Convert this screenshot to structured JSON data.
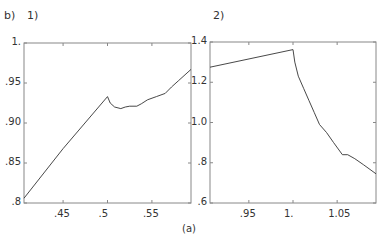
{
  "figure": {
    "panel_b_label": "b)",
    "panel1_label": "1)",
    "panel2_label": "2)",
    "caption": "(a)"
  },
  "chart_data": [
    {
      "type": "line",
      "title": "1)",
      "xlabel": "",
      "ylabel": "",
      "xlim": [
        0.406,
        0.594
      ],
      "ylim": [
        0.8,
        1.0
      ],
      "xticks": [
        0.45,
        0.5,
        0.55
      ],
      "xtick_labels": [
        ".45",
        ".5",
        ".55"
      ],
      "yticks": [
        0.8,
        0.85,
        0.9,
        0.95,
        1.0
      ],
      "ytick_labels": [
        ".8",
        ".85",
        ".90",
        ".95",
        "1."
      ],
      "grid": false,
      "series": [
        {
          "name": "curve",
          "x": [
            0.406,
            0.45,
            0.5,
            0.503,
            0.508,
            0.515,
            0.52,
            0.525,
            0.533,
            0.538,
            0.545,
            0.555,
            0.565,
            0.572,
            0.58,
            0.594
          ],
          "y": [
            0.806,
            0.868,
            0.933,
            0.925,
            0.92,
            0.918,
            0.92,
            0.921,
            0.921,
            0.924,
            0.929,
            0.933,
            0.937,
            0.945,
            0.953,
            0.967
          ]
        }
      ]
    },
    {
      "type": "line",
      "title": "2)",
      "xlabel": "",
      "ylabel": "",
      "xlim": [
        0.906,
        1.094
      ],
      "ylim": [
        0.6,
        1.4
      ],
      "xticks": [
        0.95,
        1.0,
        1.05
      ],
      "xtick_labels": [
        ".95",
        "1.",
        "1.05"
      ],
      "yticks": [
        0.6,
        0.8,
        1.0,
        1.2,
        1.4
      ],
      "ytick_labels": [
        ".6",
        ".8",
        "1.0",
        "1.2",
        "1.4"
      ],
      "grid": false,
      "series": [
        {
          "name": "curve",
          "x": [
            0.906,
            1.0,
            1.002,
            1.006,
            1.012,
            1.018,
            1.024,
            1.03,
            1.038,
            1.046,
            1.056,
            1.062,
            1.07,
            1.08,
            1.094
          ],
          "y": [
            1.275,
            1.362,
            1.3,
            1.23,
            1.17,
            1.11,
            1.05,
            0.99,
            0.95,
            0.9,
            0.84,
            0.84,
            0.82,
            0.79,
            0.745
          ]
        }
      ]
    }
  ]
}
